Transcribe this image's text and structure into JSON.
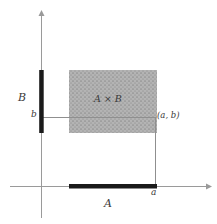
{
  "figure": {
    "background_color": "#ffffff",
    "width": 217,
    "height": 224
  },
  "colors": {
    "axis": "#9a9a9a",
    "set_bar": "#1a1a1a",
    "region_fill": "#b3b3b3",
    "region_stipple": "#8c8c8c",
    "guide_line": "#8f8f8f",
    "text": "#3a3a3a"
  },
  "labels": {
    "set_B": "B",
    "tick_b": "b",
    "product": "A × B",
    "point": "(a, b)",
    "tick_a": "a",
    "set_A": "A"
  },
  "geometry": {
    "origin": {
      "x": 41,
      "y": 186
    },
    "x_axis": {
      "x_start": 10,
      "x_end": 206,
      "y": 186,
      "arrow": "right"
    },
    "y_axis": {
      "y_start": 16,
      "y_end": 218,
      "x": 41,
      "arrow": "up"
    },
    "set_A_segment": {
      "x_start": 69,
      "x_end": 157,
      "y": 186,
      "thickness": 4
    },
    "set_B_segment": {
      "y_start": 70,
      "y_end": 133,
      "x": 41,
      "thickness": 4
    },
    "product_region": {
      "x": 69,
      "y": 70,
      "width": 88,
      "height": 63
    },
    "point_a_b": {
      "x": 156,
      "y": 117
    },
    "guide_horizontal": {
      "x_start": 41,
      "x_end": 156,
      "y": 117
    },
    "guide_vertical": {
      "x": 156,
      "y_start": 117,
      "y_end": 186
    }
  }
}
